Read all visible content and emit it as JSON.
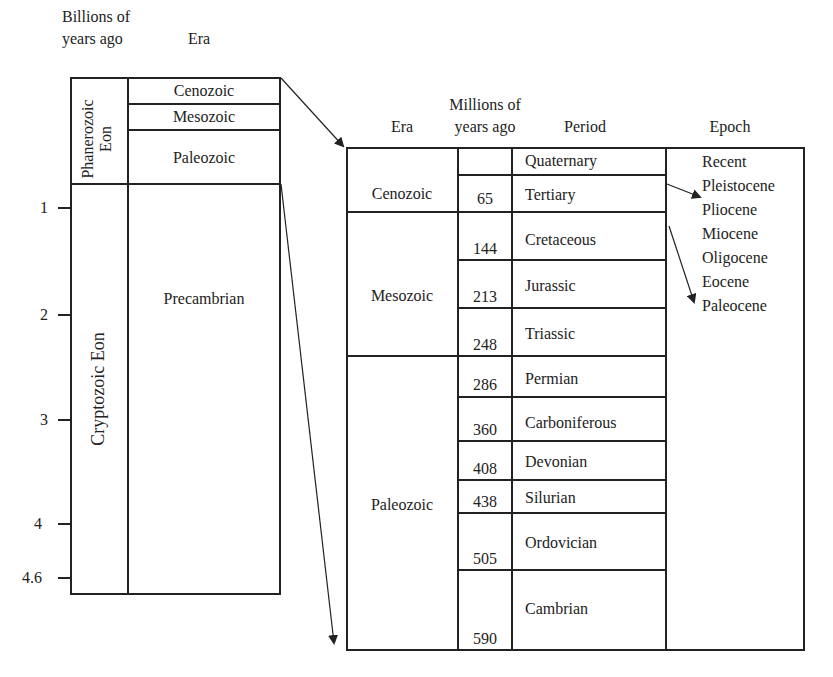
{
  "left": {
    "header_years": [
      "Billions of",
      "years ago"
    ],
    "header_era": "Era",
    "eons": [
      {
        "label_lines": [
          "Phanerozoic",
          "Eon"
        ]
      },
      {
        "label": "Cryptozoic Eon"
      }
    ],
    "eras": [
      "Cenozoic",
      "Mesozoic",
      "Paleozoic",
      "Precambrian"
    ],
    "ticks": [
      "1",
      "2",
      "3",
      "4",
      "4.6"
    ]
  },
  "right": {
    "headers": {
      "era": "Era",
      "mya": [
        "Millions of",
        "years ago"
      ],
      "period": "Period",
      "epoch": "Epoch"
    },
    "eras": [
      "Cenozoic",
      "Mesozoic",
      "Paleozoic"
    ],
    "rows": [
      {
        "mya": "",
        "period": "Quaternary"
      },
      {
        "mya": "65",
        "period": "Tertiary"
      },
      {
        "mya": "144",
        "period": "Cretaceous"
      },
      {
        "mya": "213",
        "period": "Jurassic"
      },
      {
        "mya": "248",
        "period": "Triassic"
      },
      {
        "mya": "286",
        "period": "Permian"
      },
      {
        "mya": "360",
        "period": "Carboniferous"
      },
      {
        "mya": "408",
        "period": "Devonian"
      },
      {
        "mya": "438",
        "period": "Silurian"
      },
      {
        "mya": "505",
        "period": "Ordovician"
      },
      {
        "mya": "590",
        "period": "Cambrian"
      }
    ],
    "epochs": [
      "Recent",
      "Pleistocene",
      "Pliocene",
      "Miocene",
      "Oligocene",
      "Eocene",
      "Paleocene"
    ]
  },
  "colors": {
    "ink": "#222222",
    "background": "#ffffff"
  }
}
